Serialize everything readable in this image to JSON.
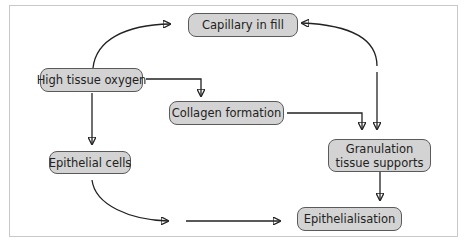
{
  "diagram": {
    "nodes": [
      {
        "id": "capillary",
        "label": "Capillary in fill"
      },
      {
        "id": "high_oxygen",
        "label": "High tissue oxygen"
      },
      {
        "id": "collagen",
        "label": "Collagen formation"
      },
      {
        "id": "epithelial_cells",
        "label": "Epithelial cells"
      },
      {
        "id": "granulation_line1",
        "label": "Granulation"
      },
      {
        "id": "granulation_line2",
        "label": "tissue supports"
      },
      {
        "id": "epithelialisation",
        "label": "Epithelialisation"
      }
    ],
    "edges": [
      {
        "from": "High tissue oxygen",
        "to": "Capillary in fill",
        "style": "curved"
      },
      {
        "from": "High tissue oxygen",
        "to": "Collagen formation",
        "style": "elbow"
      },
      {
        "from": "High tissue oxygen",
        "to": "Epithelial cells",
        "style": "straight"
      },
      {
        "from": "Collagen formation",
        "to": "Granulation tissue supports",
        "style": "elbow"
      },
      {
        "from": "Granulation tissue supports",
        "to": "Capillary in fill",
        "style": "curved"
      },
      {
        "from": "Capillary in fill",
        "to": "Granulation tissue supports",
        "style": "straight"
      },
      {
        "from": "Granulation tissue supports",
        "to": "Epithelialisation",
        "style": "straight"
      },
      {
        "from": "Epithelial cells",
        "to": "Epithelialisation",
        "style": "curved-then-straight"
      }
    ]
  },
  "colors": {
    "node_fill": "#d3d3d3",
    "node_border": "#5a5a5a",
    "arrow": "#222222",
    "frame_border": "#c8c8c8"
  }
}
